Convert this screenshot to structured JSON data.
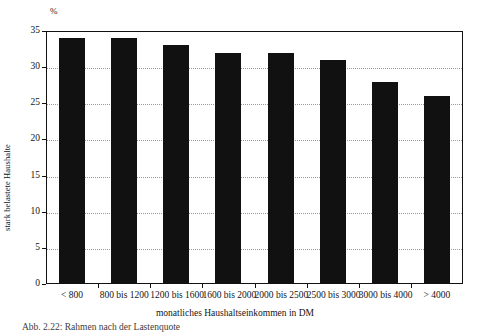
{
  "chart_data": {
    "type": "bar",
    "title": "",
    "categories": [
      "< 800",
      "800 bis 1200",
      "1200 bis 1600",
      "1600 bis 2000",
      "2000 bis 2500",
      "2500 bis 3000",
      "3000 bis 4000",
      "> 4000"
    ],
    "values": [
      34,
      34,
      33,
      32,
      32,
      31,
      28,
      26
    ],
    "unit": "%",
    "xlabel": "monatliches Haushaltseinkommen in DM",
    "ylabel": "stark belastete Haushalte",
    "ylim": [
      0,
      35
    ],
    "yticks": [
      0,
      5,
      10,
      15,
      20,
      25,
      30,
      35
    ],
    "ytick_labels": [
      "0",
      "5",
      "10",
      "15",
      "20",
      "25",
      "30",
      "35"
    ],
    "grid": "horizontal-dotted",
    "legend": "none",
    "bar_color": "#111111"
  },
  "figure": {
    "unit_label": "%",
    "caption": "Abb. 2.22: Rahmen nach der Lastenquote"
  }
}
